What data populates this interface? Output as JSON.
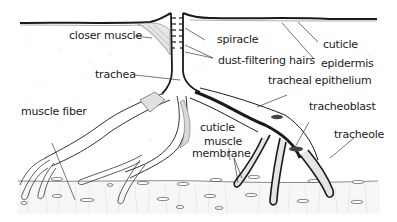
{
  "diagram": {
    "labels": [
      {
        "id": "closer_muscle",
        "text": "closer muscle"
      },
      {
        "id": "spiracle",
        "text": "spiracle"
      },
      {
        "id": "cuticle_top",
        "text": "cuticle"
      },
      {
        "id": "dust_filtering_hairs",
        "text": "dust-filtering hairs"
      },
      {
        "id": "epidermis",
        "text": "epidermis"
      },
      {
        "id": "trachea",
        "text": "trachea"
      },
      {
        "id": "tracheal_epithelium",
        "text": "tracheal epithelium"
      },
      {
        "id": "muscle_fiber",
        "text": "muscle fiber"
      },
      {
        "id": "tracheoblast",
        "text": "tracheoblast"
      },
      {
        "id": "cuticle_inner",
        "text": "cuticle"
      },
      {
        "id": "tracheole",
        "text": "tracheole"
      },
      {
        "id": "muscle_membrane_1",
        "text": "muscle"
      },
      {
        "id": "muscle_membrane_2",
        "text": "membrane"
      }
    ],
    "colors": {
      "ink": "#1a1a1a",
      "background": "#ffffff",
      "stipple": "#c8c8c8",
      "tissue_fill": "#f2f2f2"
    }
  }
}
